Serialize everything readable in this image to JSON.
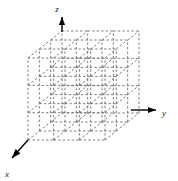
{
  "figure": {
    "background_color": "#ffffff"
  },
  "axes": {
    "z": {
      "label": "z",
      "direction": "up",
      "arrowhead": "up",
      "color": "#000000",
      "label_x": 57,
      "label_y": 10,
      "line": {
        "x1": 62,
        "y1": 32,
        "x2": 62,
        "y2": 17
      }
    },
    "y": {
      "label": "y",
      "direction": "right",
      "arrowhead": "right",
      "color": "#000000",
      "label_x": 164,
      "label_y": 114,
      "line": {
        "x1": 131,
        "y1": 110,
        "x2": 156,
        "y2": 110
      }
    },
    "x": {
      "label": "x",
      "direction": "down-left",
      "arrowhead": "down-left",
      "color": "#000000",
      "label_x": 7,
      "label_y": 175,
      "line": {
        "x1": 28,
        "y1": 140,
        "x2": 12,
        "y2": 158
      }
    }
  },
  "lattice": {
    "divisions": 3,
    "nodes_per_edge": 4,
    "line_color": "#6e6e6e",
    "line_style": "dashed",
    "line_width": 0.9,
    "dash_pattern": "2.4 2.1",
    "front_face": {
      "left": 28,
      "top": 58,
      "width": 77,
      "height": 82
    },
    "depth_offset": {
      "dx": 34,
      "dy": -27
    },
    "origin_corner": {
      "x": 28,
      "y": 140
    },
    "corners": {
      "front_bottom_left": {
        "x": 28,
        "y": 140
      },
      "front_bottom_right": {
        "x": 105,
        "y": 140
      },
      "front_top_left": {
        "x": 28,
        "y": 58
      },
      "front_top_right": {
        "x": 105,
        "y": 58
      },
      "back_bottom_left": {
        "x": 62,
        "y": 113
      },
      "back_bottom_right": {
        "x": 139,
        "y": 113
      },
      "back_top_left": {
        "x": 62,
        "y": 31
      },
      "back_top_right": {
        "x": 139,
        "y": 31
      }
    }
  }
}
